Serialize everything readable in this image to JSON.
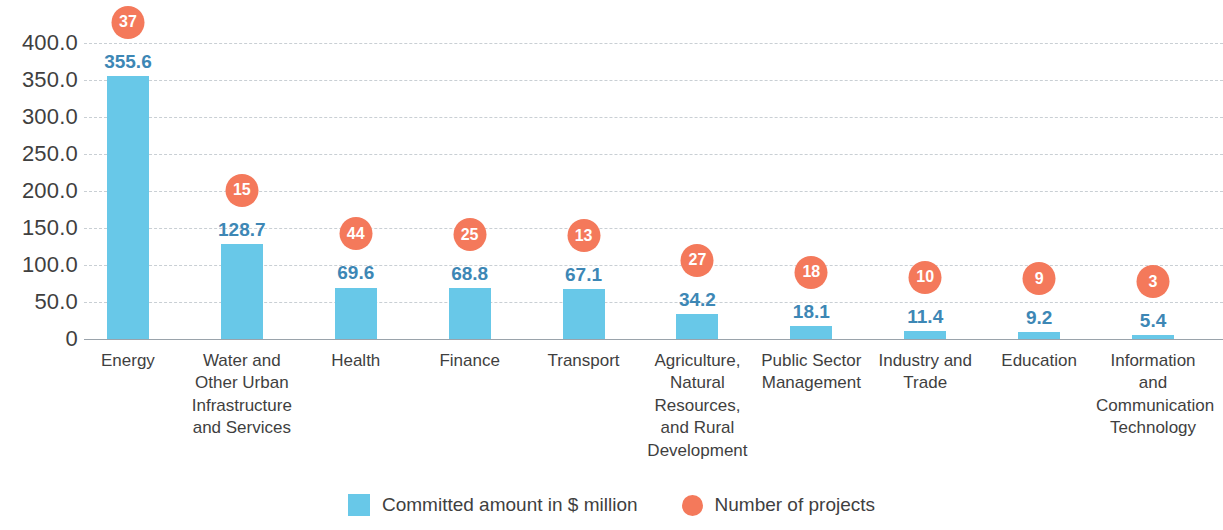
{
  "chart_data": {
    "type": "bar",
    "title": "",
    "subtitle": "",
    "xlabel": "",
    "ylabel": "",
    "ylim": [
      0,
      400
    ],
    "grid": true,
    "legend_position": "bottom-center",
    "y_ticks": [
      "0",
      "50.0",
      "100.0",
      "150.0",
      "200.0",
      "250.0",
      "300.0",
      "350.0",
      "400.0"
    ],
    "y_tick_values": [
      0,
      50,
      100,
      150,
      200,
      250,
      300,
      350,
      400
    ],
    "categories": [
      "Energy",
      "Water and\nOther Urban\nInfrastructure\nand Services",
      "Health",
      "Finance",
      "Transport",
      "Agriculture,\nNatural\nResources,\nand Rural\nDevelopment",
      "Public Sector\nManagement",
      "Industry and\nTrade",
      "Education",
      "Information\nand\nCommunication\nTechnology"
    ],
    "series": [
      {
        "name": "Committed amount in $ million",
        "type": "bar",
        "color": "#68c8e8",
        "values": [
          355.6,
          128.7,
          69.6,
          68.8,
          67.1,
          34.2,
          18.1,
          11.4,
          9.2,
          5.4
        ],
        "labels": [
          "355.6",
          "128.7",
          "69.6",
          "68.8",
          "67.1",
          "34.2",
          "18.1",
          "11.4",
          "9.2",
          "5.4"
        ]
      },
      {
        "name": "Number of projects",
        "type": "marker-circle",
        "color": "#f4795b",
        "values": [
          37,
          15,
          44,
          25,
          13,
          27,
          18,
          10,
          9,
          3
        ],
        "labels": [
          "37",
          "15",
          "44",
          "25",
          "13",
          "27",
          "18",
          "10",
          "9",
          "3"
        ]
      }
    ]
  },
  "legend": {
    "items": [
      {
        "label": "Committed amount in $ million",
        "marker": "square-swatch-icon",
        "color": "#68c8e8"
      },
      {
        "label": "Number of projects",
        "marker": "circle-swatch-icon",
        "color": "#f4795b"
      }
    ]
  },
  "colors": {
    "bar": "#68c8e8",
    "circle": "#f4795b",
    "bar_value_text": "#3d87b5",
    "axis_text": "#3f3f3f",
    "gridline": "#c9cfd4",
    "baseline": "#9aa3ab",
    "background": "#ffffff"
  }
}
